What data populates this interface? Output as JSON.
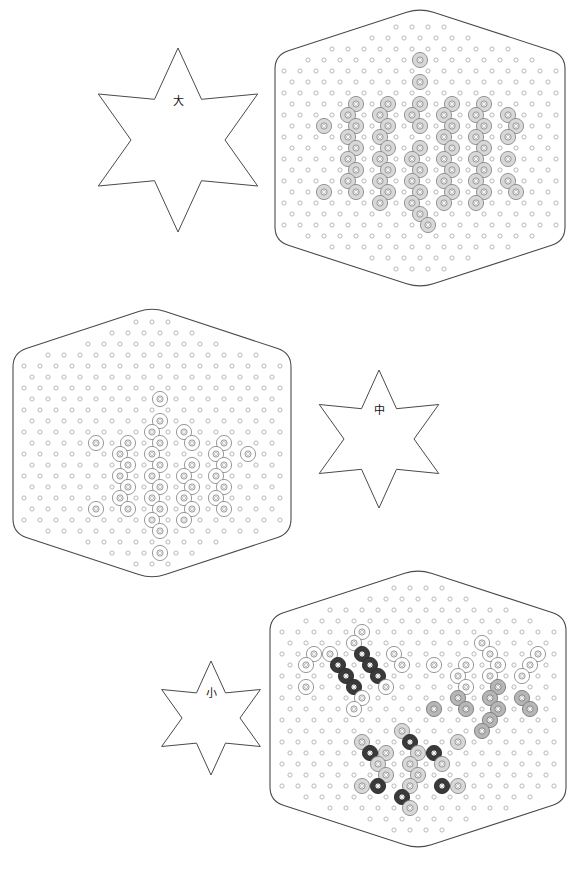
{
  "sheet": {
    "title": "Hexagon Pegboard Bead Pattern Sheet",
    "width": 579,
    "height": 879,
    "background": "#ffffff"
  },
  "palette": {
    "outline": "#4a4a4a",
    "peg_empty_stroke": "#b9b9b9",
    "bead_white_fill": "#ffffff",
    "bead_white_stroke": "#8e8e8e",
    "bead_light_fill": "#d8d8d8",
    "bead_light_stroke": "#8a8a8a",
    "bead_gray_fill": "#b6b6b6",
    "bead_gray_stroke": "#7a7a7a",
    "bead_dark_fill": "#3a3a3a",
    "bead_dark_stroke": "#2a2a2a",
    "label_text": "#111111"
  },
  "geometry": {
    "peg_pitch_x": 16,
    "peg_pitch_y": 11,
    "peg_radius": 2.1,
    "bead_outer_radius": 7.6,
    "bead_inner_radius": 3.1,
    "bead_core_radius": 1.6
  },
  "stars": [
    {
      "name": "star-large",
      "label": "大",
      "label_meaning": "large",
      "cx": 178,
      "cy": 140,
      "outer_radius": 92,
      "inner_radius": 47,
      "label_dy": -38
    },
    {
      "name": "star-medium",
      "label": "中",
      "label_meaning": "medium",
      "cx": 379,
      "cy": 439,
      "outer_radius": 69,
      "inner_radius": 35,
      "label_dy": -28
    },
    {
      "name": "star-small",
      "label": "小",
      "label_meaning": "small",
      "cx": 211,
      "cy": 718,
      "outer_radius": 57,
      "inner_radius": 29,
      "label_dy": -24
    }
  ],
  "boards": [
    {
      "name": "board-large-top-right",
      "size_label": "大",
      "cx": 420,
      "cy": 148,
      "half_width": 145,
      "side_half_height": 93,
      "apex_height": 140,
      "corner_radius": 14,
      "grid_rows": 25,
      "grid_cols": 19,
      "beads": [
        {
          "color": "light",
          "r": 4,
          "c": 9
        },
        {
          "color": "light",
          "r": 6,
          "c": 9
        },
        {
          "color": "light",
          "r": 8,
          "c": 5
        },
        {
          "color": "light",
          "r": 8,
          "c": 7
        },
        {
          "color": "light",
          "r": 8,
          "c": 9
        },
        {
          "color": "light",
          "r": 8,
          "c": 11
        },
        {
          "color": "light",
          "r": 8,
          "c": 13
        },
        {
          "color": "light",
          "r": 9,
          "c": 4
        },
        {
          "color": "light",
          "r": 9,
          "c": 6
        },
        {
          "color": "light",
          "r": 9,
          "c": 8
        },
        {
          "color": "light",
          "r": 9,
          "c": 10
        },
        {
          "color": "light",
          "r": 9,
          "c": 12
        },
        {
          "color": "light",
          "r": 9,
          "c": 14
        },
        {
          "color": "light",
          "r": 10,
          "c": 3
        },
        {
          "color": "light",
          "r": 10,
          "c": 5
        },
        {
          "color": "light",
          "r": 10,
          "c": 7
        },
        {
          "color": "light",
          "r": 10,
          "c": 9
        },
        {
          "color": "light",
          "r": 10,
          "c": 11
        },
        {
          "color": "light",
          "r": 10,
          "c": 13
        },
        {
          "color": "light",
          "r": 10,
          "c": 15
        },
        {
          "color": "light",
          "r": 11,
          "c": 4
        },
        {
          "color": "light",
          "r": 11,
          "c": 6
        },
        {
          "color": "light",
          "r": 11,
          "c": 10
        },
        {
          "color": "light",
          "r": 11,
          "c": 12
        },
        {
          "color": "light",
          "r": 11,
          "c": 14
        },
        {
          "color": "light",
          "r": 12,
          "c": 5
        },
        {
          "color": "light",
          "r": 12,
          "c": 7
        },
        {
          "color": "light",
          "r": 12,
          "c": 9
        },
        {
          "color": "light",
          "r": 12,
          "c": 11
        },
        {
          "color": "light",
          "r": 12,
          "c": 13
        },
        {
          "color": "light",
          "r": 13,
          "c": 4
        },
        {
          "color": "light",
          "r": 13,
          "c": 6
        },
        {
          "color": "light",
          "r": 13,
          "c": 8
        },
        {
          "color": "light",
          "r": 13,
          "c": 10
        },
        {
          "color": "light",
          "r": 13,
          "c": 12
        },
        {
          "color": "light",
          "r": 13,
          "c": 14
        },
        {
          "color": "light",
          "r": 14,
          "c": 5
        },
        {
          "color": "light",
          "r": 14,
          "c": 7
        },
        {
          "color": "light",
          "r": 14,
          "c": 9
        },
        {
          "color": "light",
          "r": 14,
          "c": 11
        },
        {
          "color": "light",
          "r": 14,
          "c": 13
        },
        {
          "color": "light",
          "r": 15,
          "c": 4
        },
        {
          "color": "light",
          "r": 15,
          "c": 6
        },
        {
          "color": "light",
          "r": 15,
          "c": 8
        },
        {
          "color": "light",
          "r": 15,
          "c": 10
        },
        {
          "color": "light",
          "r": 15,
          "c": 12
        },
        {
          "color": "light",
          "r": 15,
          "c": 14
        },
        {
          "color": "light",
          "r": 16,
          "c": 3
        },
        {
          "color": "light",
          "r": 16,
          "c": 5
        },
        {
          "color": "light",
          "r": 16,
          "c": 7
        },
        {
          "color": "light",
          "r": 16,
          "c": 9
        },
        {
          "color": "light",
          "r": 16,
          "c": 11
        },
        {
          "color": "light",
          "r": 16,
          "c": 13
        },
        {
          "color": "light",
          "r": 16,
          "c": 15
        },
        {
          "color": "light",
          "r": 17,
          "c": 6
        },
        {
          "color": "light",
          "r": 17,
          "c": 8
        },
        {
          "color": "light",
          "r": 17,
          "c": 10
        },
        {
          "color": "light",
          "r": 17,
          "c": 12
        },
        {
          "color": "light",
          "r": 18,
          "c": 9
        },
        {
          "color": "light",
          "r": 19,
          "c": 9
        }
      ]
    },
    {
      "name": "board-medium-middle-left",
      "size_label": "中",
      "cx": 152,
      "cy": 443,
      "half_width": 139,
      "side_half_height": 90,
      "apex_height": 136,
      "corner_radius": 14,
      "grid_rows": 25,
      "grid_cols": 18,
      "beads": [
        {
          "color": "white",
          "r": 8,
          "c": 9
        },
        {
          "color": "white",
          "r": 10,
          "c": 9
        },
        {
          "color": "white",
          "r": 11,
          "c": 8
        },
        {
          "color": "white",
          "r": 11,
          "c": 10
        },
        {
          "color": "white",
          "r": 12,
          "c": 5
        },
        {
          "color": "white",
          "r": 12,
          "c": 7
        },
        {
          "color": "white",
          "r": 12,
          "c": 9
        },
        {
          "color": "white",
          "r": 12,
          "c": 11
        },
        {
          "color": "white",
          "r": 12,
          "c": 13
        },
        {
          "color": "white",
          "r": 13,
          "c": 6
        },
        {
          "color": "white",
          "r": 13,
          "c": 8
        },
        {
          "color": "white",
          "r": 13,
          "c": 12
        },
        {
          "color": "white",
          "r": 13,
          "c": 14
        },
        {
          "color": "white",
          "r": 14,
          "c": 7
        },
        {
          "color": "white",
          "r": 14,
          "c": 9
        },
        {
          "color": "white",
          "r": 14,
          "c": 11
        },
        {
          "color": "white",
          "r": 14,
          "c": 13
        },
        {
          "color": "white",
          "r": 15,
          "c": 6
        },
        {
          "color": "white",
          "r": 15,
          "c": 8
        },
        {
          "color": "white",
          "r": 15,
          "c": 10
        },
        {
          "color": "white",
          "r": 15,
          "c": 12
        },
        {
          "color": "white",
          "r": 16,
          "c": 7
        },
        {
          "color": "white",
          "r": 16,
          "c": 9
        },
        {
          "color": "white",
          "r": 16,
          "c": 11
        },
        {
          "color": "white",
          "r": 16,
          "c": 13
        },
        {
          "color": "white",
          "r": 17,
          "c": 6
        },
        {
          "color": "white",
          "r": 17,
          "c": 8
        },
        {
          "color": "white",
          "r": 17,
          "c": 10
        },
        {
          "color": "white",
          "r": 17,
          "c": 12
        },
        {
          "color": "white",
          "r": 18,
          "c": 5
        },
        {
          "color": "white",
          "r": 18,
          "c": 7
        },
        {
          "color": "white",
          "r": 18,
          "c": 9
        },
        {
          "color": "white",
          "r": 18,
          "c": 11
        },
        {
          "color": "white",
          "r": 18,
          "c": 13
        },
        {
          "color": "white",
          "r": 19,
          "c": 8
        },
        {
          "color": "white",
          "r": 19,
          "c": 10
        },
        {
          "color": "white",
          "r": 20,
          "c": 9
        },
        {
          "color": "white",
          "r": 22,
          "c": 9
        }
      ]
    },
    {
      "name": "board-small-bottom-right",
      "size_label": "小",
      "cx": 418,
      "cy": 709,
      "half_width": 148,
      "side_half_height": 92,
      "apex_height": 140,
      "corner_radius": 14,
      "grid_rows": 25,
      "grid_cols": 19,
      "beads": [
        {
          "color": "white",
          "r": 5,
          "c": 5
        },
        {
          "color": "white",
          "r": 6,
          "c": 5
        },
        {
          "color": "white",
          "r": 6,
          "c": 13
        },
        {
          "color": "white",
          "r": 7,
          "c": 2
        },
        {
          "color": "white",
          "r": 7,
          "c": 3
        },
        {
          "color": "white",
          "r": 7,
          "c": 7
        },
        {
          "color": "white",
          "r": 7,
          "c": 13
        },
        {
          "color": "white",
          "r": 7,
          "c": 16
        },
        {
          "color": "dark",
          "r": 7,
          "c": 5
        },
        {
          "color": "dark",
          "r": 8,
          "c": 4
        },
        {
          "color": "dark",
          "r": 8,
          "c": 6
        },
        {
          "color": "white",
          "r": 8,
          "c": 2
        },
        {
          "color": "white",
          "r": 8,
          "c": 8
        },
        {
          "color": "white",
          "r": 8,
          "c": 10
        },
        {
          "color": "white",
          "r": 8,
          "c": 12
        },
        {
          "color": "white",
          "r": 8,
          "c": 14
        },
        {
          "color": "white",
          "r": 8,
          "c": 16
        },
        {
          "color": "dark",
          "r": 9,
          "c": 4
        },
        {
          "color": "dark",
          "r": 9,
          "c": 6
        },
        {
          "color": "white",
          "r": 9,
          "c": 11
        },
        {
          "color": "white",
          "r": 9,
          "c": 13
        },
        {
          "color": "white",
          "r": 9,
          "c": 15
        },
        {
          "color": "dark",
          "r": 10,
          "c": 5
        },
        {
          "color": "white",
          "r": 10,
          "c": 2
        },
        {
          "color": "white",
          "r": 10,
          "c": 7
        },
        {
          "color": "white",
          "r": 10,
          "c": 12
        },
        {
          "color": "gray",
          "r": 10,
          "c": 14
        },
        {
          "color": "white",
          "r": 11,
          "c": 5
        },
        {
          "color": "gray",
          "r": 11,
          "c": 11
        },
        {
          "color": "gray",
          "r": 11,
          "c": 13
        },
        {
          "color": "gray",
          "r": 11,
          "c": 15
        },
        {
          "color": "gray",
          "r": 12,
          "c": 10
        },
        {
          "color": "gray",
          "r": 12,
          "c": 12
        },
        {
          "color": "gray",
          "r": 12,
          "c": 14
        },
        {
          "color": "gray",
          "r": 12,
          "c": 16
        },
        {
          "color": "white",
          "r": 12,
          "c": 5
        },
        {
          "color": "gray",
          "r": 13,
          "c": 13
        },
        {
          "color": "gray",
          "r": 14,
          "c": 13
        },
        {
          "color": "light",
          "r": 14,
          "c": 8
        },
        {
          "color": "dark",
          "r": 15,
          "c": 8
        },
        {
          "color": "light",
          "r": 15,
          "c": 5
        },
        {
          "color": "light",
          "r": 15,
          "c": 11
        },
        {
          "color": "dark",
          "r": 16,
          "c": 6
        },
        {
          "color": "dark",
          "r": 16,
          "c": 10
        },
        {
          "color": "light",
          "r": 16,
          "c": 7
        },
        {
          "color": "light",
          "r": 16,
          "c": 9
        },
        {
          "color": "light",
          "r": 17,
          "c": 6
        },
        {
          "color": "light",
          "r": 17,
          "c": 8
        },
        {
          "color": "light",
          "r": 17,
          "c": 10
        },
        {
          "color": "light",
          "r": 18,
          "c": 7
        },
        {
          "color": "light",
          "r": 18,
          "c": 9
        },
        {
          "color": "dark",
          "r": 19,
          "c": 6
        },
        {
          "color": "dark",
          "r": 19,
          "c": 10
        },
        {
          "color": "light",
          "r": 19,
          "c": 5
        },
        {
          "color": "light",
          "r": 19,
          "c": 8
        },
        {
          "color": "light",
          "r": 19,
          "c": 11
        },
        {
          "color": "dark",
          "r": 20,
          "c": 8
        },
        {
          "color": "light",
          "r": 21,
          "c": 8
        }
      ]
    }
  ]
}
